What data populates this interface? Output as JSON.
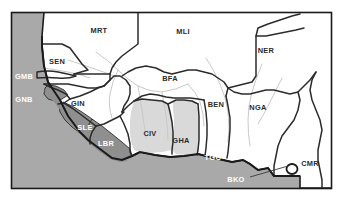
{
  "figure": {
    "type": "map",
    "region": "West Africa",
    "width": 347,
    "height": 201,
    "frame": {
      "x": 11,
      "y": 12,
      "width": 321,
      "height": 177,
      "border_color": "#1a1a1a"
    }
  },
  "colors": {
    "ocean": "#a9a9a9",
    "land_plain": "#ffffff",
    "land_light_highlight": "#d9d9d9",
    "land_dark_highlight": "#8f8f8f",
    "border_line": "#1a1a1a",
    "internal_border": "#2b2b2b",
    "river": "#c9c9c9",
    "label_land": "#2b2b2b",
    "label_sea": "#ffffff",
    "page_background": "#ffffff"
  },
  "legend_note": {
    "dark_shaded_meaning": "highlighted countries (dark grey fill)",
    "light_shaded_meaning": "secondary highlighted countries (light grey fill)"
  },
  "labels": [
    {
      "code": "MRT",
      "name": "Mauritania",
      "x": 99,
      "y": 30,
      "style": "land",
      "fill": "plain"
    },
    {
      "code": "MLI",
      "name": "Mali",
      "x": 183,
      "y": 31,
      "style": "land",
      "fill": "plain"
    },
    {
      "code": "NER",
      "name": "Niger",
      "x": 266,
      "y": 50,
      "style": "land",
      "fill": "plain"
    },
    {
      "code": "SEN",
      "name": "Senegal",
      "x": 57,
      "y": 61,
      "style": "land",
      "fill": "plain"
    },
    {
      "code": "GMB",
      "name": "Gambia",
      "x": 22,
      "y": 76,
      "style": "sea",
      "fill": "plain"
    },
    {
      "code": "GNB",
      "name": "Guinea-Bissau",
      "x": 22,
      "y": 99,
      "style": "sea",
      "fill": "dark"
    },
    {
      "code": "GIN",
      "name": "Guinea",
      "x": 76,
      "y": 103,
      "style": "land",
      "fill": "plain"
    },
    {
      "code": "BFA",
      "name": "Burkina Faso",
      "x": 170,
      "y": 78,
      "style": "land",
      "fill": "plain"
    },
    {
      "code": "BEN",
      "name": "Benin",
      "x": 216,
      "y": 104,
      "style": "land",
      "fill": "plain"
    },
    {
      "code": "NGA",
      "name": "Nigeria",
      "x": 258,
      "y": 107,
      "style": "land",
      "fill": "plain"
    },
    {
      "code": "SLE",
      "name": "Sierra Leone",
      "x": 85,
      "y": 127,
      "style": "sea",
      "fill": "dark"
    },
    {
      "code": "LBR",
      "name": "Liberia",
      "x": 105,
      "y": 143,
      "style": "sea",
      "fill": "dark"
    },
    {
      "code": "CIV",
      "name": "Côte d'Ivoire",
      "x": 150,
      "y": 133,
      "style": "land",
      "fill": "light"
    },
    {
      "code": "GHA",
      "name": "Ghana",
      "x": 180,
      "y": 140,
      "style": "land",
      "fill": "light"
    },
    {
      "code": "TGO",
      "name": "Togo",
      "x": 213,
      "y": 157,
      "style": "sea",
      "fill": "plain"
    },
    {
      "code": "BKO",
      "name": "Bioko",
      "x": 235,
      "y": 179,
      "style": "sea",
      "fill": "plain"
    },
    {
      "code": "CMR",
      "name": "Cameroon",
      "x": 310,
      "y": 163,
      "style": "land",
      "fill": "plain"
    }
  ],
  "leader_line": {
    "from_label": "BKO",
    "x1": 250,
    "y1": 176,
    "x2": 290,
    "y2": 166,
    "target_shape": "small-island-circle",
    "target_x": 292,
    "target_y": 169
  },
  "highlighted_countries_dark": [
    "GNB",
    "SLE",
    "LBR"
  ],
  "highlighted_countries_light": [
    "CIV",
    "GHA"
  ]
}
